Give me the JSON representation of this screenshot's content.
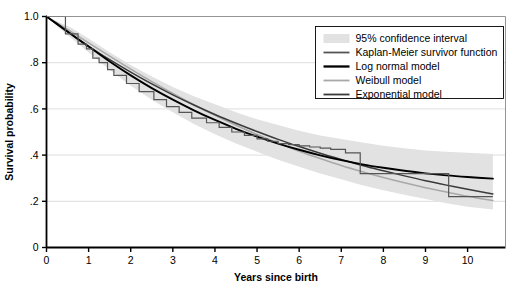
{
  "chart_data": {
    "type": "line",
    "title": "",
    "xlabel": "Years since birth",
    "ylabel": "Survival probability",
    "xlim": [
      0,
      10.9
    ],
    "ylim": [
      0,
      1.0
    ],
    "grid": "horizontal",
    "legend_position": "top-right",
    "xticks": [
      "0",
      "1",
      "2",
      "3",
      "4",
      "5",
      "6",
      "7",
      "8",
      "9",
      "10"
    ],
    "xtick_values": [
      0,
      1,
      2,
      3,
      4,
      5,
      6,
      7,
      8,
      9,
      10
    ],
    "yticks": [
      "0",
      ".2",
      ".4",
      ".6",
      ".8",
      "1.0"
    ],
    "ytick_values": [
      0,
      0.2,
      0.4,
      0.6,
      0.8,
      1.0
    ],
    "series": [
      {
        "name": "95% confidence interval",
        "type": "band",
        "color": "#e2e2e2",
        "x": [
          0.0,
          0.3,
          0.6,
          1.0,
          1.5,
          2.0,
          2.5,
          3.0,
          3.5,
          4.0,
          4.5,
          5.0,
          5.5,
          6.0,
          6.5,
          7.0,
          7.5,
          8.0,
          8.5,
          9.0,
          9.5,
          10.0,
          10.6
        ],
        "upper": [
          1.0,
          0.975,
          0.95,
          0.905,
          0.845,
          0.79,
          0.74,
          0.695,
          0.655,
          0.62,
          0.585,
          0.555,
          0.53,
          0.505,
          0.485,
          0.47,
          0.455,
          0.44,
          0.43,
          0.42,
          0.415,
          0.41,
          0.405
        ],
        "lower": [
          1.0,
          0.95,
          0.905,
          0.845,
          0.77,
          0.7,
          0.64,
          0.585,
          0.535,
          0.49,
          0.45,
          0.415,
          0.38,
          0.35,
          0.32,
          0.295,
          0.27,
          0.248,
          0.228,
          0.21,
          0.192,
          0.176,
          0.165
        ]
      },
      {
        "name": "Kaplan-Meier survivor function",
        "type": "step",
        "color": "#555555",
        "x": [
          0.0,
          0.45,
          0.45,
          0.75,
          0.75,
          0.95,
          0.95,
          1.1,
          1.1,
          1.25,
          1.25,
          1.45,
          1.45,
          1.6,
          1.6,
          1.9,
          1.9,
          2.2,
          2.2,
          2.55,
          2.55,
          2.85,
          2.85,
          3.15,
          3.15,
          3.45,
          3.45,
          3.8,
          3.8,
          4.1,
          4.1,
          4.4,
          4.4,
          4.7,
          4.7,
          5.0,
          5.0,
          5.25,
          5.25,
          5.5,
          5.5,
          5.75,
          5.75,
          6.0,
          6.0,
          6.25,
          6.25,
          6.5,
          6.5,
          6.75,
          6.75,
          7.1,
          7.1,
          7.45,
          7.45,
          9.55,
          9.55,
          10.6
        ],
        "y": [
          1.0,
          1.0,
          0.925,
          0.925,
          0.88,
          0.88,
          0.86,
          0.86,
          0.82,
          0.82,
          0.8,
          0.8,
          0.77,
          0.77,
          0.745,
          0.745,
          0.71,
          0.71,
          0.675,
          0.675,
          0.64,
          0.64,
          0.61,
          0.61,
          0.585,
          0.585,
          0.56,
          0.56,
          0.54,
          0.54,
          0.52,
          0.52,
          0.5,
          0.5,
          0.485,
          0.485,
          0.47,
          0.47,
          0.46,
          0.46,
          0.45,
          0.45,
          0.445,
          0.445,
          0.44,
          0.44,
          0.435,
          0.435,
          0.43,
          0.43,
          0.425,
          0.425,
          0.41,
          0.41,
          0.32,
          0.32,
          0.22,
          0.22
        ]
      },
      {
        "name": "Log normal model",
        "type": "smooth",
        "color": "#000000",
        "x": [
          0.0,
          0.25,
          0.5,
          0.75,
          1.0,
          1.5,
          2.0,
          2.5,
          3.0,
          3.5,
          4.0,
          4.5,
          5.0,
          5.5,
          6.0,
          6.5,
          7.0,
          7.5,
          8.0,
          8.5,
          9.0,
          9.5,
          10.0,
          10.6
        ],
        "y": [
          1.0,
          0.968,
          0.935,
          0.902,
          0.87,
          0.805,
          0.745,
          0.69,
          0.64,
          0.594,
          0.552,
          0.514,
          0.48,
          0.45,
          0.423,
          0.399,
          0.378,
          0.36,
          0.345,
          0.332,
          0.321,
          0.312,
          0.305,
          0.298
        ]
      },
      {
        "name": "Weibull model",
        "type": "smooth",
        "color": "#a8a8a8",
        "x": [
          0.0,
          0.25,
          0.5,
          0.75,
          1.0,
          1.5,
          2.0,
          2.5,
          3.0,
          3.5,
          4.0,
          4.5,
          5.0,
          5.5,
          6.0,
          6.5,
          7.0,
          7.5,
          8.0,
          8.5,
          9.0,
          9.5,
          10.0,
          10.6
        ],
        "y": [
          1.0,
          0.972,
          0.944,
          0.915,
          0.886,
          0.828,
          0.772,
          0.718,
          0.667,
          0.618,
          0.572,
          0.529,
          0.489,
          0.452,
          0.417,
          0.385,
          0.355,
          0.328,
          0.303,
          0.28,
          0.259,
          0.24,
          0.222,
          0.203
        ]
      },
      {
        "name": "Exponential model",
        "type": "smooth",
        "color": "#3a3a3a",
        "x": [
          0.0,
          0.25,
          0.5,
          0.75,
          1.0,
          1.5,
          2.0,
          2.5,
          3.0,
          3.5,
          4.0,
          4.5,
          5.0,
          5.5,
          6.0,
          6.5,
          7.0,
          7.5,
          8.0,
          8.5,
          9.0,
          9.5,
          10.0,
          10.6
        ],
        "y": [
          1.0,
          0.966,
          0.933,
          0.902,
          0.871,
          0.813,
          0.759,
          0.708,
          0.661,
          0.617,
          0.576,
          0.538,
          0.502,
          0.468,
          0.437,
          0.408,
          0.381,
          0.355,
          0.332,
          0.31,
          0.289,
          0.27,
          0.252,
          0.232
        ]
      }
    ]
  },
  "legend": {
    "items": [
      {
        "label": "95% confidence interval",
        "swatch": "band",
        "color": "#e2e2e2"
      },
      {
        "label": "Kaplan-Meier survivor function",
        "swatch": "line",
        "color": "#555555"
      },
      {
        "label": "Log normal model",
        "swatch": "line",
        "color": "#000000"
      },
      {
        "label": "Weibull model",
        "swatch": "line",
        "color": "#a8a8a8"
      },
      {
        "label": "Exponential model",
        "swatch": "line",
        "color": "#3a3a3a"
      }
    ]
  }
}
